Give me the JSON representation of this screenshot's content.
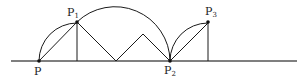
{
  "diagram": {
    "stroke_color": "#1a1a1a",
    "baseline_color": "#555555",
    "points": {
      "P": {
        "label": "P",
        "sub": "",
        "x": 39,
        "y": 61
      },
      "P1": {
        "label": "P",
        "sub": "1",
        "x": 77,
        "y": 22
      },
      "P2": {
        "label": "P",
        "sub": "2",
        "x": 170,
        "y": 61
      },
      "P3": {
        "label": "P",
        "sub": "3",
        "x": 208,
        "y": 23
      }
    },
    "zigzag_peak": {
      "x": 143,
      "y": 34
    },
    "zigzag_valley": {
      "x": 116,
      "y": 61
    },
    "baseline": {
      "x1": 11,
      "x2": 297,
      "y": 61
    }
  }
}
